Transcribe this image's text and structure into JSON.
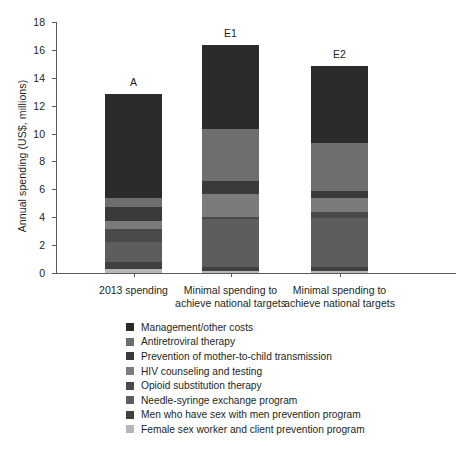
{
  "chart_data": {
    "type": "bar",
    "title": "",
    "subtitle": "",
    "xlabel": "",
    "ylabel": "Annual spending (US$, millions)",
    "ylim": [
      0,
      18
    ],
    "ytick_labels": [
      "0",
      "2",
      "4",
      "6",
      "8",
      "10",
      "12",
      "14",
      "16",
      "18"
    ],
    "yticks": [
      0,
      2,
      4,
      6,
      8,
      10,
      12,
      14,
      16,
      18
    ],
    "grid": false,
    "legend_position": "below",
    "stacked": true,
    "categories": [
      "2013 spending",
      "Minimal spending to\nachieve national targets",
      "Minimal spending to\nachieve national targets"
    ],
    "category_lines": [
      [
        "2013 spending"
      ],
      [
        "Minimal spending to",
        "achieve national targets"
      ],
      [
        "Minimal spending to",
        "achieve national targets"
      ]
    ],
    "bar_captions": [
      "A",
      "E1",
      "E2"
    ],
    "totals": [
      12.85,
      16.35,
      14.85
    ],
    "series": [
      {
        "name": "Management/other costs",
        "color": "#2b2b2b",
        "values": [
          7.45,
          6.05,
          5.55
        ]
      },
      {
        "name": "Antiretroviral therapy",
        "color": "#6d6e70",
        "values": [
          0.65,
          3.7,
          3.45
        ]
      },
      {
        "name": "Prevention of mother-to-child transmission",
        "color": "#3a3a3a",
        "values": [
          1.05,
          0.95,
          0.45
        ]
      },
      {
        "name": "HIV counseling and testing",
        "color": "#7a7b7d",
        "values": [
          0.55,
          1.6,
          1.05
        ]
      },
      {
        "name": "Opioid substitution therapy",
        "color": "#4a4a4a",
        "values": [
          0.9,
          0.2,
          0.4
        ]
      },
      {
        "name": "Needle-syringe exchange program",
        "color": "#5c5d5f",
        "values": [
          1.45,
          3.45,
          3.55
        ]
      },
      {
        "name": "Men who have sex with men prevention program",
        "color": "#404041",
        "values": [
          0.5,
          0.25,
          0.25
        ]
      },
      {
        "name": "Female sex worker and client prevention program",
        "color": "#b6b7b9",
        "values": [
          0.3,
          0.15,
          0.15
        ]
      }
    ]
  },
  "axis": {
    "ylabel": "Annual spending (US$, millions)",
    "ytick_labels": [
      "18",
      "16",
      "14",
      "12",
      "10",
      "8",
      "6",
      "4",
      "2",
      "0"
    ]
  },
  "legend": {
    "items": [
      {
        "label": "Management/other costs",
        "color": "#2b2b2b"
      },
      {
        "label": "Antiretroviral therapy",
        "color": "#6d6e70"
      },
      {
        "label": "Prevention of mother-to-child transmission",
        "color": "#3a3a3a"
      },
      {
        "label": "HIV counseling and testing",
        "color": "#7a7b7d"
      },
      {
        "label": "Opioid substitution therapy",
        "color": "#4a4a4a"
      },
      {
        "label": "Needle-syringe exchange program",
        "color": "#5c5d5f"
      },
      {
        "label": "Men who have sex with men prevention program",
        "color": "#404041"
      },
      {
        "label": "Female sex worker and client prevention program",
        "color": "#b6b7b9"
      }
    ]
  },
  "colors": {
    "axis": "#58595b",
    "text": "#231f20",
    "background": "#ffffff"
  }
}
